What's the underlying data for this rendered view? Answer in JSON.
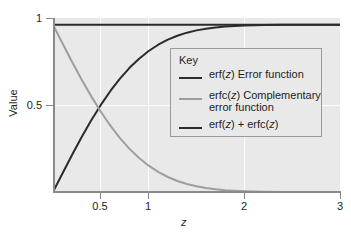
{
  "chart_data": {
    "type": "line",
    "title": "",
    "xlabel": "z",
    "ylabel": "Value",
    "xlim": [
      0,
      3
    ],
    "ylim": [
      0,
      1.04
    ],
    "grid": true,
    "legend_position": "inside-upper-right",
    "legend_title": "Key",
    "x_ticks": [
      {
        "value": 0.5,
        "label": "0.5"
      },
      {
        "value": 1,
        "label": "1"
      },
      {
        "value": 2,
        "label": "2"
      },
      {
        "value": 3,
        "label": "3"
      }
    ],
    "y_ticks": [
      {
        "value": 0.5,
        "label": "0.5"
      },
      {
        "value": 1,
        "label": "1"
      }
    ],
    "x": [
      0,
      0.1,
      0.2,
      0.3,
      0.4,
      0.5,
      0.6,
      0.7,
      0.8,
      0.9,
      1.0,
      1.1,
      1.2,
      1.3,
      1.4,
      1.5,
      1.6,
      1.7,
      1.8,
      1.9,
      2.0,
      2.2,
      2.4,
      2.6,
      2.8,
      3.0
    ],
    "series": [
      {
        "name": "erf(z) Error function",
        "color": "#2b2b2b",
        "width": 2,
        "values": [
          0,
          0.1125,
          0.2227,
          0.3286,
          0.4284,
          0.5205,
          0.6039,
          0.6778,
          0.7421,
          0.7969,
          0.8427,
          0.8802,
          0.9103,
          0.934,
          0.9523,
          0.9661,
          0.9763,
          0.9838,
          0.9891,
          0.9928,
          0.9953,
          0.9981,
          0.9993,
          0.9998,
          0.9999,
          1.0
        ]
      },
      {
        "name": "erfc(z) Complementary error function",
        "color": "#9e9e9e",
        "width": 2,
        "values": [
          1,
          0.8875,
          0.7773,
          0.6714,
          0.5716,
          0.4795,
          0.3961,
          0.3222,
          0.2579,
          0.2031,
          0.1573,
          0.1198,
          0.0897,
          0.066,
          0.0477,
          0.0339,
          0.0237,
          0.0162,
          0.0109,
          0.0072,
          0.0047,
          0.0019,
          0.0007,
          0.0002,
          0.0001,
          0.0
        ]
      },
      {
        "name": "erf(z) + erfc(z)",
        "color": "#2b2b2b",
        "width": 2,
        "values": [
          1,
          1,
          1,
          1,
          1,
          1,
          1,
          1,
          1,
          1,
          1,
          1,
          1,
          1,
          1,
          1,
          1,
          1,
          1,
          1,
          1,
          1,
          1,
          1,
          1,
          1
        ]
      }
    ],
    "annotations": []
  },
  "legend": {
    "title": "Key",
    "entries": [
      {
        "label_html": "erf(<i>z</i>) Error function",
        "color": "#2b2b2b"
      },
      {
        "label_html": "erfc(<i>z</i>) Complementary error function",
        "color": "#9e9e9e"
      },
      {
        "label_html": "erf(<i>z</i>) + erfc(<i>z</i>)",
        "color": "#2b2b2b"
      }
    ]
  },
  "axes": {
    "x_title": "z",
    "y_title": "Value"
  },
  "colors": {
    "plot_background": "#e9e9e9",
    "page_background": "#ffffff",
    "gridline": "#fbfbfb",
    "axis": "#8a8a8a",
    "erf": "#2b2b2b",
    "erfc": "#9e9e9e"
  }
}
